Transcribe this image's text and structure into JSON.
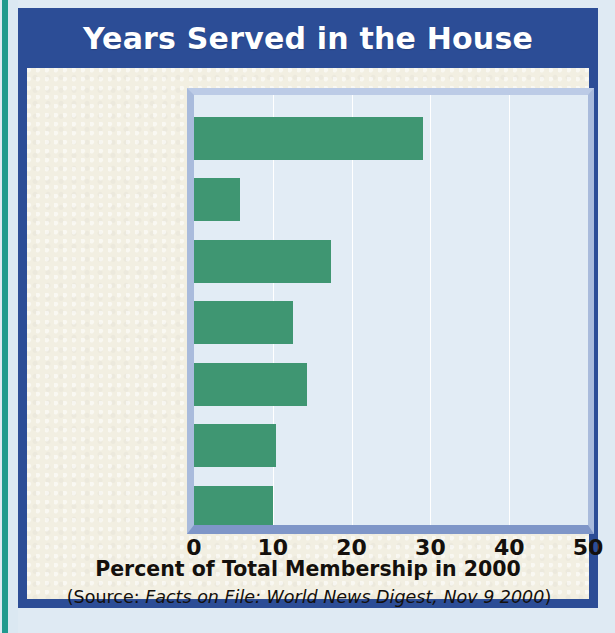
{
  "figure": {
    "title": "Years Served in the House",
    "source_prefix": "(Source: ",
    "source_publication": "Facts on File: World News Digest, Nov 9 2000",
    "source_suffix": ")"
  },
  "colors": {
    "title_band": "#2c4d96",
    "bar_green": "#3f9672",
    "plot_background": "#e2ecf5",
    "page_cream": "#f2efe2",
    "edge_teal": "#219a8e",
    "plot_bevel": "#a9bbdc",
    "axis_bottom": "#7f96c8"
  },
  "chart_data": {
    "type": "bar",
    "orientation": "horizontal",
    "title": "Years Served in the House",
    "xlabel": "Percent of Total Membership in 2000",
    "ylabel": "",
    "categories": [
      "12+ years",
      "10–12 years",
      "8–10 years",
      "6–8 years",
      "4–6 years",
      "2–4 years",
      "0–2 years"
    ],
    "values": [
      29,
      5.8,
      17.4,
      12.5,
      14.4,
      10.4,
      10
    ],
    "xlim": [
      0,
      50
    ],
    "xticks": [
      0,
      10,
      20,
      30,
      40,
      50
    ],
    "xtick_labels": [
      "0",
      "10",
      "20",
      "30",
      "40",
      "50"
    ],
    "grid": "vertical",
    "legend": "none",
    "series": [
      {
        "name": "Percent of Total Membership in 2000",
        "values": [
          29,
          5.8,
          17.4,
          12.5,
          14.4,
          10.4,
          10
        ]
      }
    ]
  }
}
